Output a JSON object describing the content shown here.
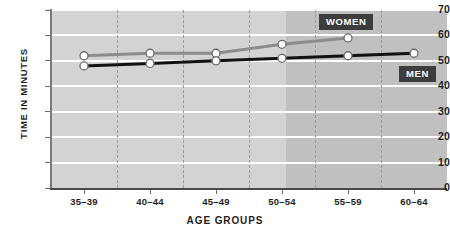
{
  "chart_data": {
    "type": "line",
    "title": "",
    "xlabel": "AGE GROUPS",
    "ylabel": "TIME IN MINUTES",
    "categories": [
      "35–39",
      "40–44",
      "45–49",
      "50–54",
      "55–59",
      "60–64"
    ],
    "ylim": [
      0,
      70
    ],
    "yticks": [
      0,
      10,
      20,
      30,
      40,
      50,
      60,
      70
    ],
    "ytick_labels": [
      "0",
      "10",
      "20",
      "30",
      "40",
      "50",
      "60",
      "70"
    ],
    "grid": "horizontal-white-and-vertical-dashed",
    "legend_position": "inline-labels",
    "series": [
      {
        "name": "WOMEN",
        "color": "#8c8c8c",
        "values": [
          52,
          53,
          53,
          56.5,
          59,
          null
        ]
      },
      {
        "name": "MEN",
        "color": "#111111",
        "values": [
          48,
          49,
          50,
          51,
          52,
          53
        ]
      }
    ],
    "annotations": [
      {
        "label": "WOMEN",
        "color": "#3d3d3d",
        "text_color": "#ffffff"
      },
      {
        "label": "MEN",
        "color": "#3d3d3d",
        "text_color": "#ffffff"
      }
    ],
    "shading": {
      "note": "darker background band covering 50–54 through 60–64",
      "light_color": "#d3d3d3",
      "dark_color": "#c0c0c0"
    },
    "marker": {
      "shape": "circle",
      "fill": "#ffffff",
      "edge": "#6b6b6b"
    }
  },
  "axes": {
    "y_title": "TIME IN MINUTES",
    "x_title": "AGE GROUPS"
  },
  "legend": {
    "women_label": "WOMEN",
    "men_label": "MEN"
  }
}
